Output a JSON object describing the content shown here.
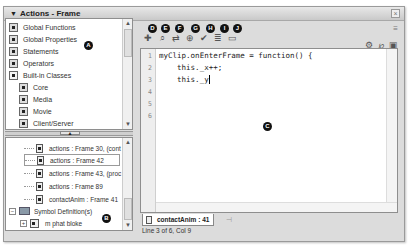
{
  "window": {
    "title": "Actions - Frame",
    "collapse_icon": "triangle-down-icon",
    "close_icon": "close-icon",
    "panel_menu_icon": "panel-menu-icon"
  },
  "toolbox": {
    "items": [
      {
        "label": "Global Functions",
        "icon": "book-icon",
        "indent": 0
      },
      {
        "label": "Global Properties",
        "icon": "book-icon",
        "indent": 0
      },
      {
        "label": "Statements",
        "icon": "book-icon",
        "indent": 0
      },
      {
        "label": "Operators",
        "icon": "book-icon",
        "indent": 0
      },
      {
        "label": "Built-in Classes",
        "icon": "open-book-icon",
        "indent": 0,
        "selected": true
      },
      {
        "label": "Core",
        "icon": "book-icon",
        "indent": 1
      },
      {
        "label": "Media",
        "icon": "book-icon",
        "indent": 1
      },
      {
        "label": "Movie",
        "icon": "book-icon",
        "indent": 1
      },
      {
        "label": "Client/Server",
        "icon": "book-icon",
        "indent": 1
      }
    ]
  },
  "navigator": {
    "items": [
      {
        "label": "actions : Frame 30, (cont",
        "icon": "script-icon"
      },
      {
        "label": "actions : Frame 42",
        "icon": "script-icon",
        "selected": true
      },
      {
        "label": "actions : Frame 43, (proc",
        "icon": "script-icon"
      },
      {
        "label": "actions : Frame 89",
        "icon": "script-icon"
      },
      {
        "label": "contactAnim : Frame 41",
        "icon": "script-icon"
      },
      {
        "label": "Symbol Definition(s)",
        "icon": "symbol-icon",
        "expander": "−"
      },
      {
        "label": "m phat bloke",
        "icon": "movieclip-icon",
        "expander": "+"
      }
    ]
  },
  "callouts": {
    "A": "A",
    "B": "B",
    "C": "C",
    "D": "D",
    "E": "E",
    "F": "F",
    "G": "G",
    "H": "H",
    "I": "I",
    "J": "J"
  },
  "toolbar": {
    "icons": [
      {
        "name": "add-script-item-icon",
        "glyph": "✚"
      },
      {
        "name": "find-icon",
        "glyph": "⌕"
      },
      {
        "name": "replace-icon",
        "glyph": "⇄"
      },
      {
        "name": "insert-target-path-icon",
        "glyph": "⊕"
      },
      {
        "name": "check-syntax-icon",
        "glyph": "✔"
      },
      {
        "name": "auto-format-icon",
        "glyph": "≣"
      },
      {
        "name": "show-code-hint-icon",
        "glyph": "▭"
      }
    ],
    "right_icons": [
      {
        "name": "debug-options-icon",
        "glyph": "⚙"
      },
      {
        "name": "script-assist-icon",
        "glyph": "℘"
      },
      {
        "name": "help-icon",
        "glyph": "▣"
      }
    ]
  },
  "editor": {
    "line_numbers": [
      "1",
      "2",
      "3",
      "4",
      "5",
      "6"
    ],
    "lines": [
      "myClip.onEnterFrame = function() {",
      "    this._x++;",
      "    this._y"
    ]
  },
  "tab": {
    "label": "contactAnim : 41",
    "pin_icon": "pin-icon"
  },
  "status": {
    "text": "Line 3 of 6, Col 9"
  }
}
